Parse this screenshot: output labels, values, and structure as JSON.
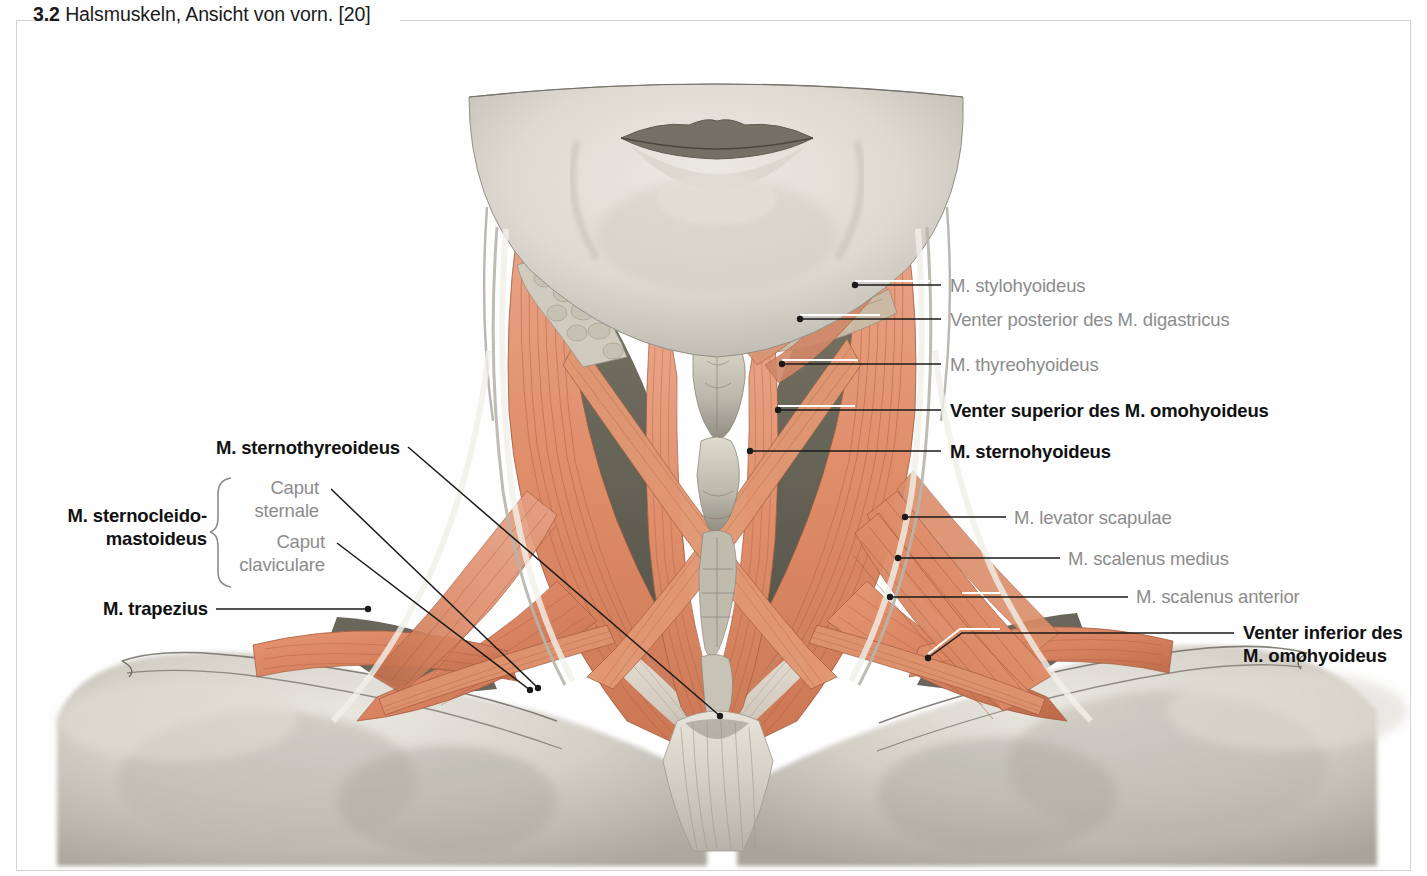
{
  "caption": {
    "number": "3.2",
    "text": "Halsmuskeln, Ansicht von vorn. [20]"
  },
  "colors": {
    "frame": "#d3d3d3",
    "label_gray": "#8c8c8c",
    "label_bold": "#111111",
    "leader": "#1a1a1a",
    "leader_highlight": "#ffffff",
    "muscle": "#e2906c",
    "muscle_dark": "#b35f3c",
    "tendon": "#d8d4cb",
    "skin_gray": "#c9c7bf",
    "shadow": "#8d8b84"
  },
  "figure": {
    "title": "Halsmuskeln, Ansicht von vorn.",
    "source_ref": "[20]",
    "view": "anterior view of the neck muscles"
  },
  "labels_right": [
    {
      "id": "m-stylohyoideus",
      "text": "M. stylohyoideus",
      "emphasis": "gray",
      "x": 950,
      "y": 275
    },
    {
      "id": "venter-post-digastricus",
      "text": "Venter posterior des M. digastricus",
      "emphasis": "gray",
      "x": 950,
      "y": 309
    },
    {
      "id": "m-thyreohyoideus",
      "text": "M. thyreohyoideus",
      "emphasis": "gray",
      "x": 950,
      "y": 354
    },
    {
      "id": "venter-sup-omohyoideus",
      "text": "Venter superior des M. omohyoideus",
      "emphasis": "bold",
      "x": 950,
      "y": 400
    },
    {
      "id": "m-sternohyoideus",
      "text": "M. sternohyoideus",
      "emphasis": "bold",
      "x": 950,
      "y": 441
    },
    {
      "id": "m-levator-scapulae",
      "text": "M. levator scapulae",
      "emphasis": "gray",
      "x": 1014,
      "y": 507
    },
    {
      "id": "m-scalenus-medius",
      "text": "M. scalenus medius",
      "emphasis": "gray",
      "x": 1068,
      "y": 548
    },
    {
      "id": "m-scalenus-anterior",
      "text": "M. scalenus anterior",
      "emphasis": "gray",
      "x": 1136,
      "y": 586
    },
    {
      "id": "venter-inf-omohyoideus",
      "text": "Venter inferior des\nM. omohyoideus",
      "emphasis": "bold",
      "x": 1243,
      "y": 622
    }
  ],
  "labels_left": [
    {
      "id": "m-sternothyreoideus",
      "text": "M. sternothyreoideus",
      "emphasis": "bold",
      "right_x": 400,
      "y": 437
    },
    {
      "id": "m-sternocleidomastoideus",
      "text": "M. sternocleido-\nmastoideus",
      "emphasis": "bold",
      "right_x": 207,
      "y": 505
    },
    {
      "id": "caput-sternale",
      "text": "Caput\nsternale",
      "emphasis": "gray",
      "right_x": 319,
      "y": 477
    },
    {
      "id": "caput-claviculare",
      "text": "Caput\nclaviculare",
      "emphasis": "gray",
      "right_x": 325,
      "y": 531
    },
    {
      "id": "m-trapezius",
      "text": "M. trapezius",
      "emphasis": "bold",
      "right_x": 208,
      "y": 598
    }
  ],
  "brace": {
    "id": "sternocleidomastoideus-brace",
    "x": 216,
    "top": 476,
    "bottom": 588
  }
}
